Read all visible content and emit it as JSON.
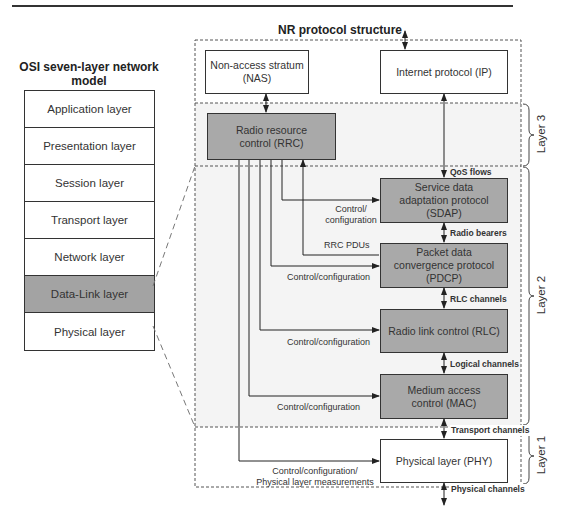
{
  "osi": {
    "title": "OSI seven-layer network model",
    "layers": [
      {
        "label": "Application layer",
        "highlighted": false
      },
      {
        "label": "Presentation layer",
        "highlighted": false
      },
      {
        "label": "Session layer",
        "highlighted": false
      },
      {
        "label": "Transport layer",
        "highlighted": false
      },
      {
        "label": "Network layer",
        "highlighted": false
      },
      {
        "label": "Data-Link layer",
        "highlighted": true
      },
      {
        "label": "Physical layer",
        "highlighted": false
      }
    ]
  },
  "nr": {
    "title": "NR protocol structure",
    "boxes": {
      "nas": "Non-access stratum (NAS)",
      "ip": "Internet protocol (IP)",
      "rrc": "Radio resource control (RRC)",
      "sdap": "Service data adaptation protocol (SDAP)",
      "pdcp": "Packet data convergence protocol (PDCP)",
      "rlc": "Radio link control (RLC)",
      "mac": "Medium access control (MAC)",
      "phy": "Physical layer (PHY)"
    },
    "channels": {
      "qos": "QoS flows",
      "radio_bearers": "Radio bearers",
      "rlc_channels": "RLC channels",
      "logical": "Logical channels",
      "transport": "Transport channels",
      "physical": "Physical channels"
    },
    "control_labels": {
      "sdap": "Control/ configuration",
      "rrc_pdus": "RRC PDUs",
      "pdcp": "Control/configuration",
      "rlc": "Control/configuration",
      "mac": "Control/configuration",
      "phy_line1": "Control/configuration/",
      "phy_line2": "Physical layer measurements"
    },
    "layers": {
      "l3": "Layer 3",
      "l2": "Layer 2",
      "l1": "Layer 1"
    }
  },
  "colors": {
    "highlight_gray": "#a9a9a9",
    "line": "#333333"
  }
}
